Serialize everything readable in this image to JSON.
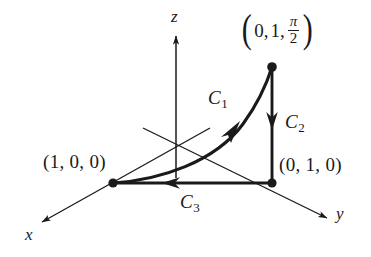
{
  "figure": {
    "type": "vector-field-path-diagram",
    "background_color": "#ffffff",
    "ink_color": "#1a1a1a",
    "axes": [
      {
        "name": "x",
        "label": "x",
        "direction": "down-left"
      },
      {
        "name": "y",
        "label": "y",
        "direction": "down-right"
      },
      {
        "name": "z",
        "label": "z",
        "direction": "up"
      }
    ],
    "points": [
      {
        "id": "p-x-axis",
        "label": "(1, 0, 0)",
        "coords": [
          1,
          0,
          0
        ]
      },
      {
        "id": "p-y-axis",
        "label": "(0, 1, 0)",
        "coords": [
          0,
          1,
          0
        ]
      },
      {
        "id": "p-top",
        "label_parts": {
          "open": "(",
          "first": "0,",
          "second": "1,",
          "frac_num": "π",
          "frac_den": "2",
          "close": ")"
        },
        "label_plain": "(0, 1, π/2)"
      }
    ],
    "curves": [
      {
        "id": "C1",
        "label": "C",
        "subscript": "1",
        "shape": "curve",
        "from": "(1, 0, 0)",
        "to": "(0, 1, π/2)",
        "arrow": "mid-upward-right"
      },
      {
        "id": "C2",
        "label": "C",
        "subscript": "2",
        "shape": "segment",
        "from": "(0, 1, π/2)",
        "to": "(0, 1, 0)",
        "arrow": "downward"
      },
      {
        "id": "C3",
        "label": "C",
        "subscript": "3",
        "shape": "segment",
        "from": "(0, 1, 0)",
        "to": "(1, 0, 0)",
        "arrow": "leftward"
      }
    ]
  }
}
